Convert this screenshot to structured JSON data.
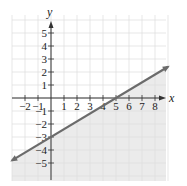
{
  "chart_data": {
    "type": "line",
    "title": "",
    "xlabel": "x",
    "ylabel": "y",
    "xlim": [
      -3,
      9
    ],
    "ylim": [
      -6,
      6
    ],
    "grid": true,
    "x_ticks": [
      -2,
      -1,
      1,
      2,
      3,
      4,
      5,
      6,
      7,
      8
    ],
    "y_ticks": [
      5,
      4,
      3,
      2,
      1,
      -1,
      -2,
      -3,
      -4,
      -5
    ],
    "series": [
      {
        "name": "boundary line",
        "equation": "y = (3/5)x - 3",
        "slope": 0.6,
        "intercept": -3,
        "x": [
          -3,
          0,
          5,
          9
        ],
        "y": [
          -4.8,
          -3,
          0,
          2.4
        ],
        "style": "solid",
        "arrows": "both",
        "color": "#6b6b6b"
      }
    ],
    "shaded_region": {
      "description": "half-plane below the line",
      "inequality": "y <= (3/5)x - 3",
      "color": "#ebebeb"
    },
    "key_points": [
      {
        "label": "y-intercept",
        "x": 0,
        "y": -3
      },
      {
        "label": "x-intercept",
        "x": 5,
        "y": 0
      }
    ]
  },
  "labels": {
    "x_axis": "x",
    "y_axis": "y",
    "x_ticks": [
      "−2",
      "−1",
      "1",
      "2",
      "3",
      "4",
      "5",
      "6",
      "7",
      "8"
    ],
    "y_ticks": [
      "5",
      "4",
      "3",
      "2",
      "1",
      "−1",
      "−2",
      "−3",
      "−4",
      "−5"
    ]
  },
  "colors": {
    "grid": "#dcdcdc",
    "axis": "#333333",
    "line": "#6b6b6b",
    "shade": "#ebebeb"
  }
}
